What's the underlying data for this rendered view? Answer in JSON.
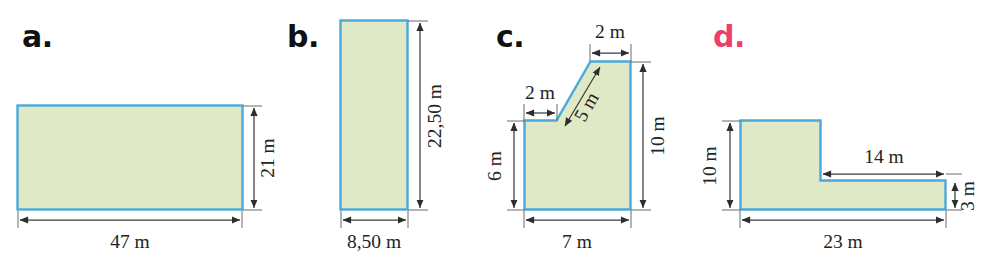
{
  "page": {
    "background_color": "#ffffff",
    "width": 998,
    "height": 257
  },
  "style": {
    "shape_fill": "#dfe9c6",
    "shape_stroke": "#4ba8dc",
    "dimension_line_color": "#3d3d3d",
    "label_color_default": "#111111",
    "label_color_d": "#ec3f6a",
    "unit": "m"
  },
  "figures": [
    {
      "id": "a",
      "label": "a.",
      "label_color": "#111111",
      "shape": "rectangle",
      "dimensions": [
        {
          "name": "width",
          "value": "47 m",
          "orientation": "horizontal",
          "position": "bottom"
        },
        {
          "name": "height",
          "value": "21 m",
          "orientation": "vertical",
          "position": "right"
        }
      ]
    },
    {
      "id": "b",
      "label": "b.",
      "label_color": "#111111",
      "shape": "rectangle",
      "dimensions": [
        {
          "name": "width",
          "value": "8,50 m",
          "orientation": "horizontal",
          "position": "bottom"
        },
        {
          "name": "height",
          "value": "22,50 m",
          "orientation": "vertical",
          "position": "right"
        }
      ]
    },
    {
      "id": "c",
      "label": "c.",
      "label_color": "#111111",
      "shape": "stepped-polygon-with-diagonal",
      "dimensions": [
        {
          "name": "top-step",
          "value": "2 m",
          "orientation": "horizontal",
          "position": "top"
        },
        {
          "name": "left-step",
          "value": "2 m",
          "orientation": "horizontal",
          "position": "upper-left"
        },
        {
          "name": "diagonal",
          "value": "5 m",
          "orientation": "diagonal",
          "position": "interior"
        },
        {
          "name": "left-height",
          "value": "6 m",
          "orientation": "vertical",
          "position": "left"
        },
        {
          "name": "right-height",
          "value": "10 m",
          "orientation": "vertical",
          "position": "right"
        },
        {
          "name": "base",
          "value": "7 m",
          "orientation": "horizontal",
          "position": "bottom"
        }
      ]
    },
    {
      "id": "d",
      "label": "d.",
      "label_color": "#ec3f6a",
      "shape": "l-shape",
      "dimensions": [
        {
          "name": "left-height",
          "value": "10 m",
          "orientation": "vertical",
          "position": "left"
        },
        {
          "name": "upper-arm",
          "value": "14 m",
          "orientation": "horizontal",
          "position": "interior-top"
        },
        {
          "name": "arm-height",
          "value": "3 m",
          "orientation": "vertical",
          "position": "right"
        },
        {
          "name": "base",
          "value": "23 m",
          "orientation": "horizontal",
          "position": "bottom"
        }
      ]
    }
  ]
}
